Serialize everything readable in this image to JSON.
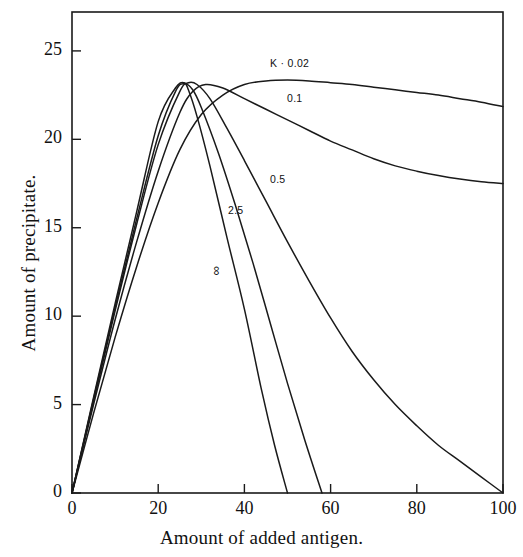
{
  "figure": {
    "background_color": "#ffffff",
    "line_color": "#1a1a1a",
    "frame_color": "#1a1a1a"
  },
  "axes": {
    "x_title": "Amount of added antigen.",
    "y_title": "Amount of precipitate.",
    "x_ticks": [
      "0",
      "20",
      "40",
      "60",
      "80",
      "100"
    ],
    "y_ticks": [
      "0",
      "5",
      "10",
      "15",
      "20",
      "25"
    ]
  },
  "curve_labels": [
    {
      "name": "label-k-002",
      "text": "K · 0.02",
      "x": 270,
      "y": 57,
      "rotated": false
    },
    {
      "name": "label-01",
      "text": "0.1",
      "x": 287,
      "y": 92,
      "rotated": false
    },
    {
      "name": "label-05",
      "text": "0.5",
      "x": 270,
      "y": 173,
      "rotated": false
    },
    {
      "name": "label-25",
      "text": "2.5",
      "x": 228,
      "y": 204,
      "rotated": false
    },
    {
      "name": "label-infinity",
      "text": "∞",
      "x": 211,
      "y": 263,
      "rotated": true
    }
  ],
  "chart_data": {
    "type": "line",
    "title": "",
    "xlabel": "Amount of added antigen.",
    "ylabel": "Amount of precipitate.",
    "xlim": [
      0,
      100
    ],
    "ylim": [
      0,
      27.2
    ],
    "xticks": [
      0,
      20,
      40,
      60,
      80,
      100
    ],
    "yticks": [
      0,
      5,
      10,
      15,
      20,
      25
    ],
    "grid": false,
    "legend": "inline-curve-labels",
    "series": [
      {
        "name": "K = 0.02",
        "label": "K · 0.02",
        "x": [
          0,
          5,
          10,
          15,
          20,
          25,
          30,
          35,
          40,
          45,
          50,
          55,
          60,
          65,
          70,
          75,
          80,
          85,
          90,
          95,
          100
        ],
        "y": [
          0,
          4.5,
          8.8,
          12.8,
          16.4,
          19.4,
          21.4,
          22.5,
          23.1,
          23.3,
          23.35,
          23.3,
          23.2,
          23.1,
          22.95,
          22.8,
          22.65,
          22.5,
          22.3,
          22.1,
          21.85
        ]
      },
      {
        "name": "K = 0.1",
        "label": "0.1",
        "x": [
          0,
          5,
          10,
          15,
          20,
          25,
          28,
          31,
          35,
          40,
          45,
          50,
          55,
          60,
          65,
          70,
          75,
          80,
          85,
          90,
          95,
          100
        ],
        "y": [
          0,
          5.0,
          9.8,
          14.2,
          18.2,
          21.5,
          22.7,
          23.1,
          22.9,
          22.3,
          21.7,
          21.1,
          20.5,
          19.9,
          19.4,
          18.9,
          18.5,
          18.2,
          17.95,
          17.75,
          17.6,
          17.5
        ]
      },
      {
        "name": "K = 0.5",
        "label": "0.5",
        "x": [
          0,
          5,
          10,
          15,
          20,
          25,
          27,
          29,
          32,
          36,
          40,
          45,
          50,
          55,
          60,
          65,
          70,
          75,
          80,
          85,
          90,
          95,
          100
        ],
        "y": [
          0,
          5.2,
          10.3,
          15.2,
          19.7,
          22.7,
          23.2,
          23.1,
          22.3,
          20.6,
          18.8,
          16.5,
          14.2,
          12.0,
          9.9,
          8.0,
          6.4,
          5.0,
          3.8,
          2.7,
          1.8,
          0.9,
          0.0
        ]
      },
      {
        "name": "K = 2.5",
        "label": "2.5",
        "x": [
          0,
          5,
          10,
          15,
          20,
          24,
          26,
          28,
          30,
          34,
          38,
          42,
          46,
          50,
          54,
          58
        ],
        "y": [
          0,
          5.3,
          10.5,
          15.5,
          20.2,
          22.7,
          23.15,
          22.8,
          21.8,
          19.2,
          16.2,
          13.0,
          9.6,
          6.2,
          3.0,
          0.0
        ]
      },
      {
        "name": "K = infinity",
        "label": "∞",
        "x": [
          0,
          5,
          10,
          15,
          20,
          24,
          26,
          27,
          29,
          32,
          36,
          40,
          44,
          47,
          50
        ],
        "y": [
          0,
          5.4,
          10.7,
          15.9,
          21.0,
          22.9,
          23.2,
          22.8,
          21.3,
          18.5,
          14.4,
          10.4,
          5.8,
          2.7,
          0.0
        ]
      }
    ]
  }
}
